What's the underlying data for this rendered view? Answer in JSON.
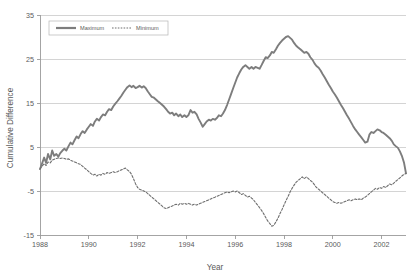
{
  "chart_data": {
    "type": "line",
    "title": "",
    "xlabel": "Year",
    "ylabel": "Cumulative Difference",
    "xlim": [
      1988,
      2003
    ],
    "ylim": [
      -15,
      35
    ],
    "xticks": [
      1988,
      1990,
      1992,
      1994,
      1996,
      1998,
      2000,
      2002
    ],
    "xtick_labels": [
      "1988",
      "1990",
      "1992",
      "1994",
      "1996",
      "1998",
      "2000",
      "2002"
    ],
    "yticks": [
      35,
      25,
      15,
      5,
      -5,
      -15
    ],
    "ytick_labels": [
      "35",
      "25",
      "15",
      "5",
      "-5",
      "-15"
    ],
    "grid": "horizontal",
    "legend_position": "top-left",
    "colors": {
      "maximum": "#7d7d7d",
      "minimum": "#6f6f6f",
      "gridline": "#c9c9c9",
      "axis": "#9a9a9a",
      "text": "#5a5a5a",
      "background": "#ffffff"
    },
    "series": [
      {
        "name": "Maximum",
        "style": "solid",
        "x": [
          1988.0,
          1988.08,
          1988.17,
          1988.25,
          1988.33,
          1988.42,
          1988.5,
          1988.58,
          1988.67,
          1988.75,
          1988.83,
          1988.92,
          1989.0,
          1989.08,
          1989.17,
          1989.25,
          1989.33,
          1989.42,
          1989.5,
          1989.58,
          1989.67,
          1989.75,
          1989.83,
          1989.92,
          1990.0,
          1990.08,
          1990.17,
          1990.25,
          1990.33,
          1990.42,
          1990.5,
          1990.58,
          1990.67,
          1990.75,
          1990.83,
          1990.92,
          1991.0,
          1991.08,
          1991.17,
          1991.25,
          1991.33,
          1991.42,
          1991.5,
          1991.58,
          1991.67,
          1991.75,
          1991.83,
          1991.92,
          1992.0,
          1992.08,
          1992.17,
          1992.25,
          1992.33,
          1992.42,
          1992.5,
          1992.58,
          1992.67,
          1992.75,
          1992.83,
          1992.92,
          1993.0,
          1993.08,
          1993.17,
          1993.25,
          1993.33,
          1993.42,
          1993.5,
          1993.58,
          1993.67,
          1993.75,
          1993.83,
          1993.92,
          1994.0,
          1994.08,
          1994.17,
          1994.25,
          1994.33,
          1994.42,
          1994.5,
          1994.58,
          1994.67,
          1994.75,
          1994.83,
          1994.92,
          1995.0,
          1995.08,
          1995.17,
          1995.25,
          1995.33,
          1995.42,
          1995.5,
          1995.58,
          1995.67,
          1995.75,
          1995.83,
          1995.92,
          1996.0,
          1996.08,
          1996.17,
          1996.25,
          1996.33,
          1996.42,
          1996.5,
          1996.58,
          1996.67,
          1996.75,
          1996.83,
          1996.92,
          1997.0,
          1997.08,
          1997.17,
          1997.25,
          1997.33,
          1997.42,
          1997.5,
          1997.58,
          1997.67,
          1997.75,
          1997.83,
          1997.92,
          1998.0,
          1998.08,
          1998.17,
          1998.25,
          1998.33,
          1998.42,
          1998.5,
          1998.58,
          1998.67,
          1998.75,
          1998.83,
          1998.92,
          1999.0,
          1999.08,
          1999.17,
          1999.25,
          1999.33,
          1999.42,
          1999.5,
          1999.58,
          1999.67,
          1999.75,
          1999.83,
          1999.92,
          2000.0,
          2000.08,
          2000.17,
          2000.25,
          2000.33,
          2000.42,
          2000.5,
          2000.58,
          2000.67,
          2000.75,
          2000.83,
          2000.92,
          2001.0,
          2001.08,
          2001.17,
          2001.25,
          2001.33,
          2001.42,
          2001.5,
          2001.58,
          2001.67,
          2001.75,
          2001.83,
          2001.92,
          2002.0,
          2002.08,
          2002.17,
          2002.25,
          2002.33,
          2002.42,
          2002.5,
          2002.58,
          2002.67,
          2002.75,
          2002.83,
          2002.92,
          2003.0
        ],
        "y": [
          0.0,
          1.2,
          2.6,
          1.4,
          3.4,
          2.2,
          4.2,
          3.0,
          3.4,
          2.8,
          3.6,
          4.2,
          4.6,
          4.2,
          5.2,
          6.0,
          5.6,
          6.6,
          7.4,
          7.0,
          8.0,
          8.6,
          8.2,
          9.0,
          9.6,
          10.2,
          9.8,
          10.8,
          11.4,
          11.0,
          11.8,
          12.4,
          12.2,
          13.0,
          13.6,
          13.4,
          14.2,
          14.8,
          15.4,
          16.0,
          16.6,
          17.4,
          18.0,
          18.6,
          19.0,
          18.6,
          18.9,
          18.4,
          18.6,
          18.9,
          18.5,
          18.8,
          18.4,
          17.6,
          17.0,
          16.4,
          16.2,
          15.8,
          15.4,
          15.0,
          14.6,
          14.2,
          13.6,
          13.0,
          12.6,
          12.8,
          12.2,
          12.6,
          12.0,
          12.4,
          11.8,
          12.2,
          11.8,
          12.2,
          13.4,
          12.8,
          13.0,
          12.4,
          11.4,
          10.6,
          9.6,
          10.2,
          10.8,
          11.2,
          11.0,
          11.4,
          11.2,
          11.6,
          12.2,
          12.0,
          12.6,
          13.4,
          14.6,
          15.8,
          17.0,
          18.4,
          19.6,
          20.8,
          21.8,
          22.6,
          23.2,
          23.6,
          23.2,
          22.8,
          23.2,
          22.8,
          23.2,
          23.0,
          22.8,
          23.6,
          24.6,
          25.4,
          25.2,
          25.8,
          26.6,
          26.4,
          27.2,
          28.0,
          28.6,
          29.2,
          29.6,
          30.0,
          30.2,
          29.8,
          29.4,
          28.6,
          28.0,
          27.6,
          27.2,
          26.8,
          26.4,
          26.6,
          26.2,
          25.4,
          24.8,
          24.0,
          23.4,
          23.0,
          22.4,
          21.6,
          20.8,
          20.0,
          19.2,
          18.4,
          17.6,
          17.0,
          16.2,
          15.4,
          14.6,
          13.8,
          13.0,
          12.2,
          11.4,
          10.6,
          9.8,
          9.0,
          8.4,
          7.8,
          7.2,
          6.6,
          6.0,
          6.2,
          7.8,
          8.4,
          8.2,
          8.6,
          9.0,
          8.8,
          8.4,
          8.2,
          7.8,
          7.4,
          7.0,
          6.4,
          5.6,
          5.2,
          4.8,
          4.0,
          3.0,
          1.4,
          -1.0
        ]
      },
      {
        "name": "Minimum",
        "style": "dotted",
        "x": [
          1988.0,
          1988.08,
          1988.17,
          1988.25,
          1988.33,
          1988.42,
          1988.5,
          1988.58,
          1988.67,
          1988.75,
          1988.83,
          1988.92,
          1989.0,
          1989.08,
          1989.17,
          1989.25,
          1989.33,
          1989.42,
          1989.5,
          1989.58,
          1989.67,
          1989.75,
          1989.83,
          1989.92,
          1990.0,
          1990.08,
          1990.17,
          1990.25,
          1990.33,
          1990.42,
          1990.5,
          1990.58,
          1990.67,
          1990.75,
          1990.83,
          1990.92,
          1991.0,
          1991.08,
          1991.17,
          1991.25,
          1991.33,
          1991.42,
          1991.5,
          1991.58,
          1991.67,
          1991.75,
          1991.83,
          1991.92,
          1992.0,
          1992.08,
          1992.17,
          1992.25,
          1992.33,
          1992.42,
          1992.5,
          1992.58,
          1992.67,
          1992.75,
          1992.83,
          1992.92,
          1993.0,
          1993.08,
          1993.17,
          1993.25,
          1993.33,
          1993.42,
          1993.5,
          1993.58,
          1993.67,
          1993.75,
          1993.83,
          1993.92,
          1994.0,
          1994.08,
          1994.17,
          1994.25,
          1994.33,
          1994.42,
          1994.5,
          1994.58,
          1994.67,
          1994.75,
          1994.83,
          1994.92,
          1995.0,
          1995.08,
          1995.17,
          1995.25,
          1995.33,
          1995.42,
          1995.5,
          1995.58,
          1995.67,
          1995.75,
          1995.83,
          1995.92,
          1996.0,
          1996.08,
          1996.17,
          1996.25,
          1996.33,
          1996.42,
          1996.5,
          1996.58,
          1996.67,
          1996.75,
          1996.83,
          1996.92,
          1997.0,
          1997.08,
          1997.17,
          1997.25,
          1997.33,
          1997.42,
          1997.5,
          1997.58,
          1997.67,
          1997.75,
          1997.83,
          1997.92,
          1998.0,
          1998.08,
          1998.17,
          1998.25,
          1998.33,
          1998.42,
          1998.5,
          1998.58,
          1998.67,
          1998.75,
          1998.83,
          1998.92,
          1999.0,
          1999.08,
          1999.17,
          1999.25,
          1999.33,
          1999.42,
          1999.5,
          1999.58,
          1999.67,
          1999.75,
          1999.83,
          1999.92,
          2000.0,
          2000.08,
          2000.17,
          2000.25,
          2000.33,
          2000.42,
          2000.5,
          2000.58,
          2000.67,
          2000.75,
          2000.83,
          2000.92,
          2001.0,
          2001.08,
          2001.17,
          2001.25,
          2001.33,
          2001.42,
          2001.5,
          2001.58,
          2001.67,
          2001.75,
          2001.83,
          2001.92,
          2002.0,
          2002.08,
          2002.17,
          2002.25,
          2002.33,
          2002.42,
          2002.5,
          2002.58,
          2002.67,
          2002.75,
          2002.83,
          2002.92,
          2003.0
        ],
        "y": [
          0.0,
          0.6,
          1.2,
          0.8,
          1.6,
          1.4,
          2.0,
          2.2,
          2.4,
          2.5,
          2.4,
          2.5,
          2.4,
          2.2,
          2.3,
          2.0,
          1.8,
          1.6,
          1.4,
          1.2,
          1.0,
          0.6,
          0.2,
          -0.2,
          -0.6,
          -1.0,
          -1.4,
          -1.2,
          -1.6,
          -1.2,
          -1.4,
          -1.0,
          -1.2,
          -0.8,
          -1.0,
          -0.8,
          -0.6,
          -0.8,
          -0.6,
          -0.4,
          -0.2,
          0.0,
          0.2,
          -0.2,
          -0.6,
          -1.2,
          -2.2,
          -3.4,
          -4.2,
          -4.6,
          -4.8,
          -5.0,
          -5.2,
          -5.6,
          -6.0,
          -6.4,
          -6.8,
          -7.2,
          -7.6,
          -8.0,
          -8.4,
          -8.8,
          -9.0,
          -8.8,
          -8.6,
          -8.4,
          -8.2,
          -8.0,
          -8.2,
          -7.8,
          -8.0,
          -7.8,
          -8.0,
          -7.8,
          -8.0,
          -8.2,
          -8.0,
          -8.2,
          -8.0,
          -7.8,
          -7.6,
          -7.4,
          -7.2,
          -7.0,
          -6.8,
          -6.6,
          -6.4,
          -6.2,
          -6.0,
          -5.8,
          -5.6,
          -5.4,
          -5.2,
          -5.4,
          -5.2,
          -5.0,
          -5.2,
          -5.0,
          -5.4,
          -5.8,
          -5.6,
          -6.0,
          -6.4,
          -6.2,
          -6.6,
          -7.0,
          -7.6,
          -8.2,
          -8.8,
          -9.4,
          -10.2,
          -11.0,
          -11.8,
          -12.4,
          -13.0,
          -12.8,
          -12.0,
          -11.2,
          -10.2,
          -9.2,
          -8.2,
          -7.2,
          -6.2,
          -5.2,
          -4.4,
          -3.6,
          -3.0,
          -2.6,
          -2.2,
          -1.8,
          -2.2,
          -1.8,
          -2.2,
          -2.6,
          -3.0,
          -3.6,
          -4.2,
          -4.6,
          -5.0,
          -5.4,
          -5.8,
          -6.2,
          -6.6,
          -7.0,
          -7.4,
          -7.6,
          -7.8,
          -7.6,
          -7.8,
          -7.6,
          -7.4,
          -7.2,
          -7.0,
          -7.2,
          -7.0,
          -6.8,
          -7.0,
          -6.8,
          -7.0,
          -6.6,
          -6.4,
          -6.0,
          -5.6,
          -5.2,
          -4.8,
          -4.4,
          -4.6,
          -4.2,
          -4.4,
          -4.0,
          -4.2,
          -3.8,
          -3.4,
          -3.6,
          -3.2,
          -2.8,
          -2.4,
          -2.0,
          -1.6,
          -1.2,
          -1.0
        ]
      }
    ],
    "legend": [
      {
        "label": "Maximum",
        "style": "solid"
      },
      {
        "label": "Minimum",
        "style": "dotted"
      }
    ]
  }
}
